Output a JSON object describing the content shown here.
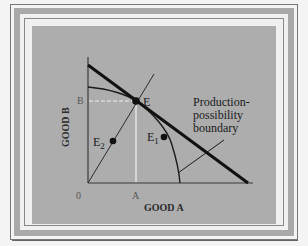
{
  "figure": {
    "background_color": "#f4f4f4",
    "frame_band_color": "#a9a9a9",
    "panel_color": "#adadad",
    "line_color": "#1a1a1a",
    "dashed_color": "#f2f2f2"
  },
  "axes": {
    "y_label": "GOOD B",
    "x_label": "GOOD A",
    "origin_label": "0",
    "x_tick_label": "A",
    "y_tick_label": "B"
  },
  "points": {
    "E": {
      "label": "E",
      "sub": ""
    },
    "E1": {
      "label": "E",
      "sub": "1"
    },
    "E2": {
      "label": "E",
      "sub": "2"
    }
  },
  "annotation": {
    "line1": "Production-",
    "line2": "possibility",
    "line3": "boundary"
  }
}
